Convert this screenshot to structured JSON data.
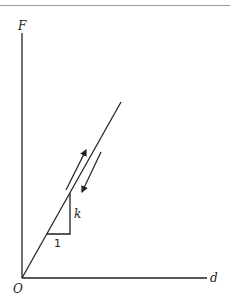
{
  "diagram": {
    "type": "force-displacement graph",
    "axes": {
      "y_label": "F",
      "x_label": "d",
      "origin_label": "O"
    },
    "line": {
      "description": "linear loading/unloading line through origin",
      "slope_label": "k"
    },
    "slope_triangle": {
      "run_label": "1",
      "rise_label": "k"
    },
    "arrows": [
      {
        "direction": "up",
        "meaning": "loading"
      },
      {
        "direction": "down",
        "meaning": "unloading"
      }
    ],
    "colors": {
      "ink": "#222222",
      "background": "#ffffff"
    }
  }
}
